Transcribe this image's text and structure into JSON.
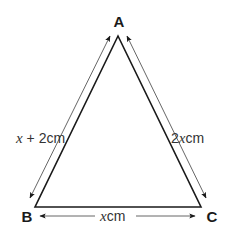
{
  "diagram": {
    "type": "triangle",
    "vertices": [
      {
        "name": "A",
        "x": 118,
        "y": 36,
        "label_x": 119,
        "label_y": 27
      },
      {
        "name": "B",
        "x": 35,
        "y": 207,
        "label_x": 27,
        "label_y": 222
      },
      {
        "name": "C",
        "x": 201,
        "y": 207,
        "label_x": 212,
        "label_y": 222
      }
    ],
    "sides": [
      {
        "between": "A-B",
        "var": "x",
        "suffix": " + 2cm",
        "label": "x + 2cm"
      },
      {
        "between": "A-C",
        "var": "x",
        "prefix": "2",
        "suffix": "cm",
        "label": "2xcm"
      },
      {
        "between": "B-C",
        "var": "x",
        "suffix": "cm",
        "label": "xcm"
      }
    ],
    "colors": {
      "triangle": "#1a1a1a",
      "arrow": "#555555",
      "background": "#ffffff"
    }
  }
}
